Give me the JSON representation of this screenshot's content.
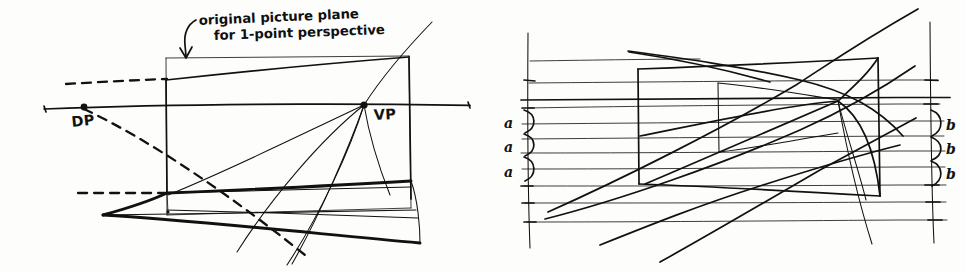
{
  "page": {
    "background_color": "#fdfdfc",
    "ink_color": "#111111",
    "width": 966,
    "height": 271,
    "medium": "hand-drawn pen sketch"
  },
  "left_diagram": {
    "name": "original picture plane construction",
    "annotation": {
      "line1": "original picture plane",
      "line2": "for 1-point perspective",
      "has_leader_arrow": true,
      "arrow_points_to": "top edge of tilted picture plane"
    },
    "points": [
      {
        "label": "DP",
        "role": "distance point / diagonal point",
        "x": 84,
        "y": 108
      },
      {
        "label": "VP",
        "role": "vanishing point",
        "x": 364,
        "y": 105
      }
    ],
    "elements": [
      "horizon line",
      "tilted picture plane rectangle",
      "original upright picture plane rectangle",
      "ground plane quadrilateral",
      "convergence rays to VP",
      "dashed diagonal construction lines from DP"
    ]
  },
  "right_diagram": {
    "name": "measuring-line division of depth",
    "left_scale": {
      "name": "near measuring line",
      "labels": [
        "a",
        "a",
        "a"
      ],
      "description": "three equal divisions marked a"
    },
    "right_scale": {
      "name": "far measuring line",
      "labels": [
        "b",
        "b",
        "b"
      ],
      "description": "three foreshortened divisions marked b"
    },
    "elements": [
      "horizontal grid lines",
      "left vertical measuring line with tick marks",
      "right vertical measuring line with tick marks",
      "box in one-point perspective",
      "inner rear face rectangle",
      "diagonal construction lines through vanishing point",
      "horizon line"
    ]
  }
}
